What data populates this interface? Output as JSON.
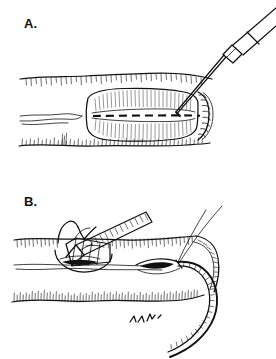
{
  "figure": {
    "type": "medical-line-illustration",
    "title_visible": false,
    "background_color": "#ffffff",
    "ink_color": "#111111",
    "width": 276,
    "height": 359,
    "panel_count": 2
  },
  "panels": [
    {
      "id": "panel-a",
      "label": "A.",
      "label_x": 24,
      "label_y": 28,
      "caption_visible": false,
      "description": "Local anesthetic infiltration of an elliptical wound with a hypodermic needle and syringe",
      "elements": [
        {
          "name": "tissue-block",
          "kind": "outline",
          "note": "horizontal band of skin/tissue with hatched upper and lower margins"
        },
        {
          "name": "wound-ellipse",
          "kind": "outline",
          "note": "central elongated oval defect with radiating hatch marks"
        },
        {
          "name": "wound-midline",
          "kind": "dashed-line",
          "note": "dashed horizontal line bisecting the wound"
        },
        {
          "name": "wound-right-margin",
          "kind": "beaded-edge",
          "note": "scalloped double border on the right edge of the defect"
        },
        {
          "name": "syringe-needle",
          "kind": "instrument",
          "note": "needle shaft angled down-left into the wound"
        },
        {
          "name": "syringe-hub",
          "kind": "instrument",
          "note": "tapered hub joining needle to barrel"
        },
        {
          "name": "syringe-barrel",
          "kind": "instrument",
          "note": "barrel extending off the upper right edge"
        }
      ]
    },
    {
      "id": "panel-b",
      "label": "B.",
      "label_x": 24,
      "label_y": 206,
      "caption_visible": false,
      "description": "Tissue forceps elevating the wound edge while a large curved suture needle with two strands passes through the tissue",
      "elements": [
        {
          "name": "tissue-block",
          "kind": "outline",
          "note": "skin band with hatched upper margin and dense lower hatching"
        },
        {
          "name": "forceps",
          "kind": "instrument",
          "note": "cross-hatched forceps angled from upper right into a raised flap"
        },
        {
          "name": "elevated-flap",
          "kind": "outline",
          "note": "lifted tissue flap at the left of the wound"
        },
        {
          "name": "wound-opening",
          "kind": "outline",
          "note": "small dark slit-shaped opening at mid-field"
        },
        {
          "name": "curved-needle",
          "kind": "instrument",
          "note": "large hatched curved suture needle sweeping down and right"
        },
        {
          "name": "suture-strands",
          "kind": "thread",
          "count": 2,
          "note": "two fine suture threads rising to the upper right"
        },
        {
          "name": "artist-marks",
          "kind": "annotation",
          "note": "small hatch squiggle marks below the tissue"
        }
      ]
    }
  ]
}
